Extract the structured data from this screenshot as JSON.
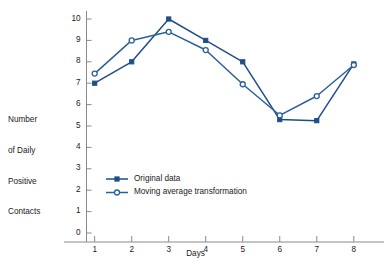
{
  "chart_data": {
    "type": "line",
    "title": "",
    "xlabel": "Days",
    "ylabel": "Number of Daily Positive Contacts",
    "ylabel_lines": [
      "Number",
      "of Daily",
      "Positive",
      "Contacts"
    ],
    "categories": [
      1,
      2,
      3,
      4,
      5,
      6,
      7,
      8
    ],
    "x": [
      1,
      2,
      3,
      4,
      5,
      6,
      7,
      8
    ],
    "xtick_labels": [
      "1",
      "2",
      "3",
      "4",
      "5",
      "6",
      "7",
      "8"
    ],
    "ytick_labels": [
      "0",
      "1",
      "2",
      "3",
      "4",
      "5",
      "6",
      "7",
      "8",
      "9",
      "10"
    ],
    "yticks": [
      0,
      1,
      2,
      3,
      4,
      5,
      6,
      7,
      8,
      9,
      10
    ],
    "xlim": [
      0.55,
      8.6
    ],
    "ylim": [
      0,
      10
    ],
    "grid": false,
    "legend_position": "lower-left-inside",
    "series": [
      {
        "name": "Original data",
        "marker": "filled-square",
        "color": "#1F4E87",
        "values": [
          7.0,
          8.0,
          10.0,
          9.0,
          8.0,
          5.3,
          5.25,
          7.9
        ]
      },
      {
        "name": "Moving average transformation",
        "marker": "open-circle",
        "color": "#2A6099",
        "values": [
          7.45,
          9.0,
          9.4,
          8.55,
          6.95,
          5.5,
          6.4,
          7.85
        ]
      }
    ]
  },
  "legend": {
    "items": [
      {
        "label": "Original data"
      },
      {
        "label": "Moving average transformation"
      }
    ]
  },
  "colors": {
    "series_primary": "#1F4E87",
    "series_secondary": "#2A6099",
    "axis": "#8a8a8a",
    "text": "#1a1a1a",
    "background": "#ffffff"
  }
}
